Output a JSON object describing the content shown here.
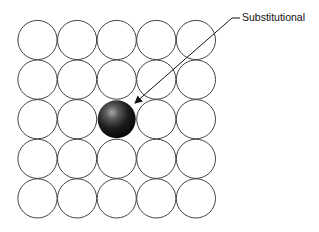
{
  "diagram": {
    "type": "crystal-lattice-point-defect",
    "grid": {
      "rows": 5,
      "cols": 5,
      "origin_x": 37.5,
      "origin_y": 40,
      "spacing": 39.6,
      "radius": 19.6,
      "stroke": "#444444"
    },
    "substitutional_atom": {
      "row": 2,
      "col": 2,
      "radius": 19,
      "color_dark": "#0c0c0c",
      "color_light": "#9a9a9a"
    },
    "annotation": {
      "label": "Substitutional",
      "leader": {
        "x1": 232,
        "y1": 18,
        "x2": 135,
        "y2": 103,
        "tail_x": 240
      }
    }
  }
}
